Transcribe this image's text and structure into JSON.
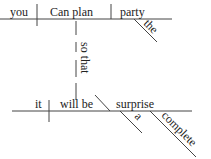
{
  "diagram": {
    "type": "sentence-diagram",
    "main_clause": {
      "subject": "you",
      "verb": "Can plan",
      "object": "party",
      "object_modifier": "the"
    },
    "connector": "so that",
    "sub_clause": {
      "subject": "it",
      "verb": "will be",
      "complement": "surprise",
      "complement_modifiers": [
        "a",
        "complete"
      ]
    }
  }
}
